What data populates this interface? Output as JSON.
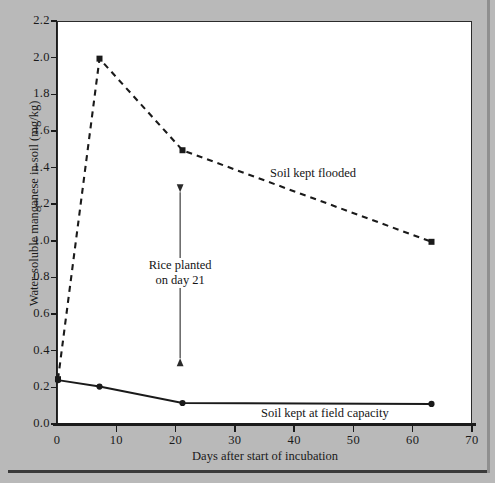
{
  "chart_data": {
    "type": "line",
    "title": "",
    "xlabel": "Days after start of incubation",
    "ylabel": "Water-soluble manganese in soil (mg/kg)",
    "xlim": [
      0,
      70
    ],
    "ylim": [
      0.0,
      2.2
    ],
    "xticks": [
      "0",
      "10",
      "20",
      "30",
      "40",
      "50",
      "60",
      "70"
    ],
    "xtick_values": [
      0,
      10,
      20,
      30,
      40,
      50,
      60,
      70
    ],
    "yticks": [
      "0.0",
      "0.2",
      "0.4",
      "0.6",
      "0.8",
      "1.0",
      "1.2",
      "1.4",
      "1.6",
      "1.8",
      "2.0",
      "2.2"
    ],
    "ytick_values": [
      0.0,
      0.2,
      0.4,
      0.6,
      0.8,
      1.0,
      1.2,
      1.4,
      1.6,
      1.8,
      2.0,
      2.2
    ],
    "grid": false,
    "legend_position": "inline-labels",
    "series": [
      {
        "name": "Soil kept flooded",
        "style": "dashed",
        "marker": "square",
        "color": "#1a1a1a",
        "x": [
          0,
          7,
          21,
          63
        ],
        "values": [
          0.25,
          2.0,
          1.5,
          1.0
        ]
      },
      {
        "name": "Soil kept at field capacity",
        "style": "solid",
        "marker": "circle",
        "color": "#1a1a1a",
        "x": [
          0,
          7,
          21,
          63
        ],
        "values": [
          0.245,
          0.21,
          0.12,
          0.115
        ]
      }
    ],
    "annotations": [
      {
        "text_line1": "Rice planted",
        "text_line2": "on day 21",
        "arrow": "double-headed-vertical",
        "at_x": 20.6,
        "from_y": 1.27,
        "to_y": 0.365
      }
    ]
  }
}
